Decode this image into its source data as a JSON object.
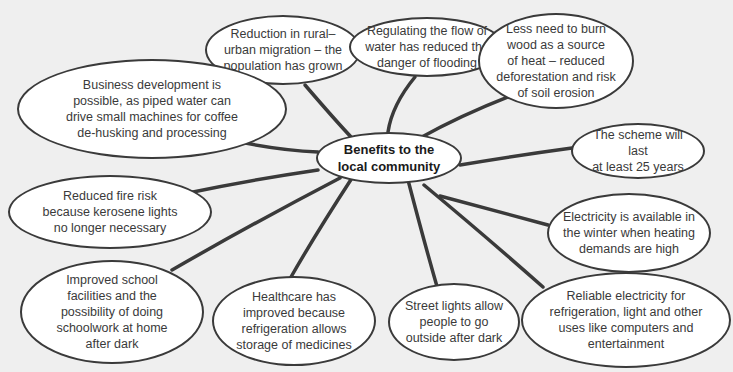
{
  "diagram": {
    "center": {
      "label": "Benefits to the\nlocal community"
    },
    "nodes": [
      {
        "id": "rural",
        "label": "Reduction in rural–\nurban migration – the\npopulation has grown"
      },
      {
        "id": "flooding",
        "label": "Regulating the flow of\nwater has reduced the\ndanger of flooding"
      },
      {
        "id": "wood",
        "label": "Less need to burn\nwood as a source\nof heat – reduced\ndeforestation and risk\nof soil erosion"
      },
      {
        "id": "business",
        "label": "Business development is\npossible, as piped water can\ndrive small machines for coffee\nde-husking and processing"
      },
      {
        "id": "scheme",
        "label": "The scheme will last\nat least 25 years"
      },
      {
        "id": "fire",
        "label": "Reduced fire risk\nbecause kerosene lights\nno longer necessary"
      },
      {
        "id": "winter",
        "label": "Electricity is available in\nthe winter when heating\ndemands are high"
      },
      {
        "id": "school",
        "label": "Improved school\nfacilities and the\npossibility of doing\nschoolwork at home\nafter dark"
      },
      {
        "id": "healthcare",
        "label": "Healthcare has\nimproved because\nrefrigeration allows\nstorage of medicines"
      },
      {
        "id": "streetlights",
        "label": "Street lights allow\npeople to go\noutside after dark"
      },
      {
        "id": "reliable",
        "label": "Reliable electricity for\nrefrigeration, light and other\nuses like computers and\nentertainment"
      }
    ]
  },
  "colors": {
    "background": "#efefef",
    "bubble_fill": "#ffffff",
    "stroke": "#3a3a3a"
  }
}
